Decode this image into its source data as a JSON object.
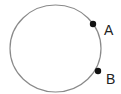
{
  "diagram": {
    "circle": {
      "cx": 55.5,
      "cy": 48.5,
      "rx": 45.5,
      "ry": 43.5,
      "stroke": "#8a8a8a",
      "stroke_width": 1.2
    },
    "points": [
      {
        "label": "A",
        "x": 93,
        "y": 24,
        "r": 3.2,
        "color": "#111111",
        "label_x": 104,
        "label_y": 35
      },
      {
        "label": "B",
        "x": 98,
        "y": 71,
        "r": 3.2,
        "color": "#111111",
        "label_x": 106,
        "label_y": 84
      }
    ]
  }
}
